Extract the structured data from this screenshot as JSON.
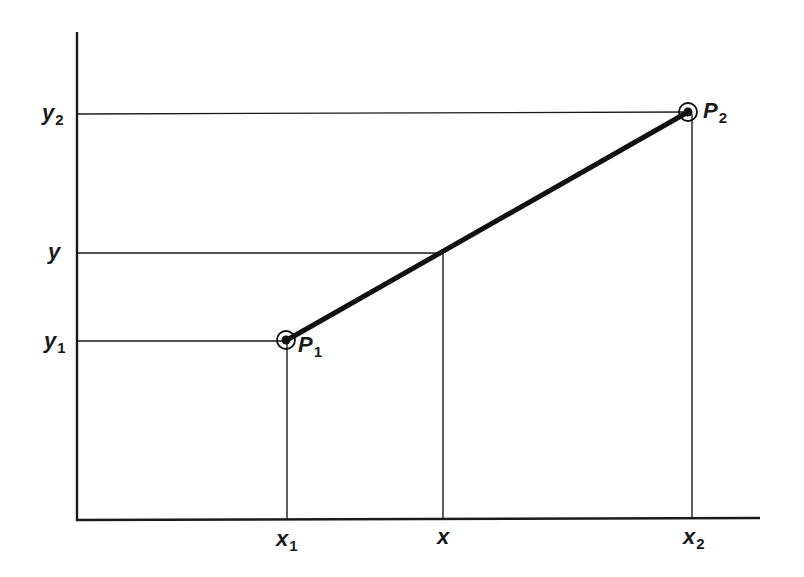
{
  "diagram": {
    "axes": {
      "origin": {
        "x": 77,
        "y": 520
      },
      "y_axis_top": 32,
      "x_axis_right": 760
    },
    "points": {
      "p1": {
        "label": "P",
        "subscript": "1",
        "x": 287,
        "y": 340
      },
      "p2": {
        "label": "P",
        "subscript": "2",
        "x": 688,
        "y": 112
      },
      "mid": {
        "x": 442,
        "y": 253
      }
    },
    "y_labels": [
      {
        "id": "y2",
        "text": "y",
        "subscript": "2",
        "y": 114
      },
      {
        "id": "y",
        "text": "y",
        "subscript": "",
        "y": 253
      },
      {
        "id": "y1",
        "text": "y",
        "subscript": "1",
        "y": 341
      }
    ],
    "x_labels": [
      {
        "id": "x1",
        "text": "x",
        "subscript": "1",
        "x": 287
      },
      {
        "id": "x",
        "text": "x",
        "subscript": "",
        "x": 443
      },
      {
        "id": "x2",
        "text": "x",
        "subscript": "2",
        "x": 692
      }
    ],
    "colors": {
      "ink": "#1a1a1a",
      "background": "#ffffff"
    }
  }
}
